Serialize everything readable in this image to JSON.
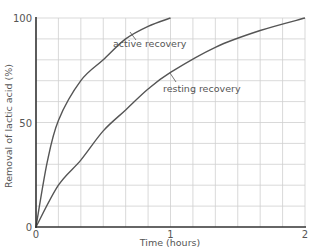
{
  "chart_data": {
    "type": "line",
    "title": "",
    "xlabel": "Time (hours)",
    "ylabel": "Removal of lactic acid (%)",
    "xlim": [
      0,
      2
    ],
    "ylim": [
      0,
      100
    ],
    "x_ticks": [
      {
        "value": 0,
        "label": "0"
      },
      {
        "value": 1,
        "label": "1"
      },
      {
        "value": 2,
        "label": "2"
      }
    ],
    "y_ticks": [
      {
        "value": 0,
        "label": "0"
      },
      {
        "value": 50,
        "label": "50"
      },
      {
        "value": 100,
        "label": "100"
      }
    ],
    "grid": {
      "on": true,
      "x_minor_step_hours": 0.1667,
      "y_minor_step": 10,
      "color": "#cfcfcf"
    },
    "legend": "inline labels with leader lines",
    "series": [
      {
        "name": "active recovery",
        "color": "#555555",
        "x_minutes": [
          0,
          5,
          10,
          20,
          30,
          40,
          50,
          60
        ],
        "values": [
          0,
          31,
          51,
          70,
          80,
          90,
          96,
          100
        ],
        "label_anchor": {
          "x": 113,
          "y": 47
        },
        "leader": {
          "x1": 130,
          "y1": 32,
          "x2": 136,
          "y2": 40
        }
      },
      {
        "name": "resting recovery",
        "color": "#555555",
        "x_minutes": [
          0,
          10,
          20,
          30,
          40,
          50,
          60,
          80,
          100,
          120
        ],
        "values": [
          0,
          20,
          32,
          46,
          56,
          66,
          74,
          86,
          94,
          100
        ],
        "label_anchor": {
          "x": 163,
          "y": 92
        },
        "leader": {
          "x1": 170,
          "y1": 73,
          "x2": 176,
          "y2": 82
        }
      }
    ]
  }
}
